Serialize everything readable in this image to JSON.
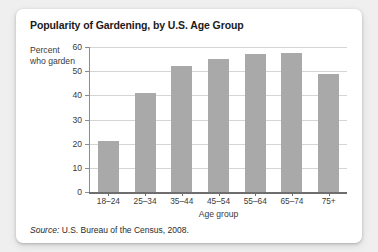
{
  "card": {
    "title": "Popularity of Gardening, by U.S. Age Group",
    "source_label": "Source:",
    "source_text": "U.S. Bureau of the Census, 2008."
  },
  "chart_data": {
    "type": "bar",
    "title": "Popularity of Gardening, by U.S. Age Group",
    "subtitle": "",
    "categories": [
      "18–24",
      "25–34",
      "35–44",
      "45–54",
      "55–64",
      "65–74",
      "75+"
    ],
    "values": [
      21,
      41,
      52,
      55,
      57,
      57.5,
      49
    ],
    "series": [
      {
        "name": "Percent who garden",
        "values": [
          21,
          41,
          52,
          55,
          57,
          57.5,
          49
        ]
      }
    ],
    "xlabel": "Age group",
    "ylabel": "Percent who garden",
    "ylabel_line1": "Percent",
    "ylabel_line2": "who garden",
    "ylim": [
      0,
      60
    ],
    "yticks": [
      0,
      10,
      20,
      30,
      40,
      50,
      60
    ],
    "ytick_labels": [
      "0",
      "10",
      "20",
      "30",
      "40",
      "50",
      "60"
    ],
    "grid": true,
    "grid_axis": "y",
    "legend": false,
    "legend_position": "none",
    "bar_color": "#a9a9a9",
    "gridline_color": "#d5d5d5",
    "axis_color": "#6e6e6e",
    "source": "Source: U.S. Bureau of the Census, 2008."
  }
}
